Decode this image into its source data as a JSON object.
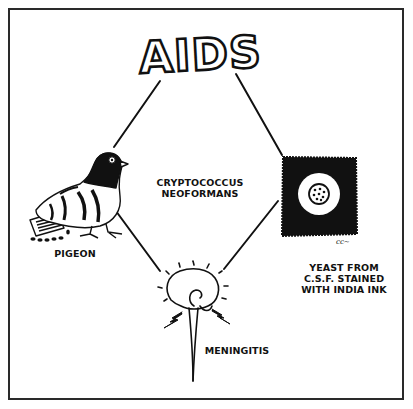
{
  "diagram": {
    "title": "AIDS",
    "center_label": {
      "line1": "CRYPTOCOCCUS",
      "line2": "NEOFORMANS"
    },
    "nodes": [
      {
        "id": "aids",
        "label": "AIDS",
        "icon": "aids-title-lettering"
      },
      {
        "id": "pigeon",
        "label": "PIGEON",
        "icon": "pigeon-illustration"
      },
      {
        "id": "yeast",
        "label_lines": [
          "YEAST FROM",
          "C.S.F. STAINED",
          "WITH INDIA INK"
        ],
        "icon": "india-ink-yeast-illustration"
      },
      {
        "id": "meningitis",
        "label": "MENINGITIS",
        "icon": "brain-spinal-cord-illustration"
      }
    ],
    "edges": [
      {
        "from": "aids",
        "to": "pigeon"
      },
      {
        "from": "aids",
        "to": "yeast"
      },
      {
        "from": "pigeon",
        "to": "meningitis"
      },
      {
        "from": "yeast",
        "to": "meningitis"
      }
    ],
    "signature": "cc~",
    "colors": {
      "ink": "#111111",
      "background": "#ffffff",
      "border": "#2a2a2a"
    }
  }
}
